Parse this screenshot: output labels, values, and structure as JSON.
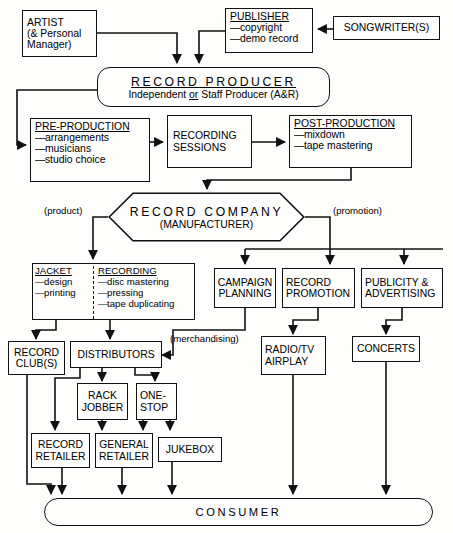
{
  "diagram": {
    "nodes": {
      "artist": {
        "title": "ARTIST",
        "line2": "(& Personal",
        "line3": "Manager)"
      },
      "publisher": {
        "title": "PUBLISHER",
        "items": [
          "copyright",
          "demo record"
        ]
      },
      "songwriter": {
        "label": "SONGWRITER(S)"
      },
      "record_producer": {
        "title": "RECORD PRODUCER",
        "sub_pre": "Independent ",
        "sub_em": "or",
        "sub_post": " Staff Producer (A&R)"
      },
      "pre_production": {
        "title": "PRE-PRODUCTION",
        "items": [
          "arrangements",
          "musicians",
          "studio choice"
        ]
      },
      "recording_sessions": {
        "line1": "RECORDING",
        "line2": "SESSIONS"
      },
      "post_production": {
        "title": "POST-PRODUCTION",
        "items": [
          "mixdown",
          "tape mastering"
        ]
      },
      "record_company": {
        "title": "RECORD COMPANY",
        "subtitle": "(MANUFACTURER)"
      },
      "jacket": {
        "title": "JACKET",
        "items": [
          "design",
          "printing"
        ]
      },
      "recording": {
        "title": "RECORDING",
        "items": [
          "disc mastering",
          "pressing",
          "tape duplicating"
        ]
      },
      "campaign_planning": {
        "line1": "CAMPAIGN",
        "line2": "PLANNING"
      },
      "record_promotion": {
        "line1": "RECORD",
        "line2": "PROMOTION"
      },
      "publicity_advertising": {
        "line1": "PUBLICITY &",
        "line2": "ADVERTISING"
      },
      "record_club": {
        "line1": "RECORD",
        "line2": "CLUB(S)"
      },
      "distributors": {
        "label": "DISTRIBUTORS"
      },
      "rack_jobber": {
        "line1": "RACK",
        "line2": "JOBBER"
      },
      "one_stop": {
        "line1": "ONE-",
        "line2": "STOP"
      },
      "radio_tv_airplay": {
        "line1": "RADIO/TV",
        "line2": "AIRPLAY"
      },
      "concerts": {
        "label": "CONCERTS"
      },
      "record_retailer": {
        "line1": "RECORD",
        "line2": "RETAILER"
      },
      "general_retailer": {
        "line1": "GENERAL",
        "line2": "RETAILER"
      },
      "jukebox": {
        "label": "JUKEBOX"
      },
      "consumer": {
        "label": "CONSUMER"
      }
    },
    "edge_labels": {
      "product": "(product)",
      "promotion": "(promotion)",
      "merchandising": "(merchandising)"
    },
    "colors": {
      "ink": "#111111",
      "paper": "#fdfdfb"
    }
  }
}
